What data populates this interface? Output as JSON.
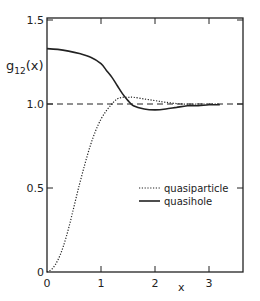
{
  "chart_data": {
    "type": "line",
    "title": "",
    "xlabel": "x",
    "ylabel": "g12(x)",
    "ylabel_main": "g",
    "ylabel_sub": "12",
    "ylabel_arg": "(x)",
    "xlim": [
      0,
      3.65
    ],
    "ylim": [
      0,
      1.5
    ],
    "xticks": [
      0,
      1,
      2,
      3
    ],
    "xtick_labels": [
      "0",
      "1",
      "2",
      "3"
    ],
    "yticks": [
      0,
      0.5,
      1.0,
      1.5
    ],
    "ytick_labels": [
      "0",
      "0.5",
      "1.0",
      "1.5"
    ],
    "grid": false,
    "legend_position": "center-right",
    "reference_line": {
      "y": 1.0,
      "style": "dashed"
    },
    "series": [
      {
        "name": "quasiparticle",
        "style": "dotted",
        "x": [
          0,
          0.1,
          0.2,
          0.3,
          0.4,
          0.5,
          0.6,
          0.7,
          0.8,
          0.9,
          1.0,
          1.1,
          1.2,
          1.3,
          1.4,
          1.5,
          1.6,
          1.8,
          2.0,
          2.2,
          2.5,
          2.8,
          3.0,
          3.2
        ],
        "values": [
          0.0,
          0.02,
          0.07,
          0.15,
          0.26,
          0.39,
          0.52,
          0.64,
          0.75,
          0.84,
          0.91,
          0.96,
          1.0,
          1.03,
          1.04,
          1.04,
          1.04,
          1.03,
          1.02,
          1.01,
          1.0,
          1.0,
          1.0,
          1.0
        ]
      },
      {
        "name": "quasihole",
        "style": "solid",
        "x": [
          0,
          0.2,
          0.4,
          0.6,
          0.8,
          1.0,
          1.1,
          1.2,
          1.3,
          1.4,
          1.5,
          1.6,
          1.8,
          2.0,
          2.2,
          2.4,
          2.6,
          2.8,
          3.0,
          3.2
        ],
        "values": [
          1.33,
          1.325,
          1.315,
          1.3,
          1.28,
          1.24,
          1.2,
          1.16,
          1.11,
          1.06,
          1.02,
          0.99,
          0.97,
          0.965,
          0.97,
          0.98,
          0.99,
          0.99,
          0.995,
          0.995
        ]
      }
    ]
  }
}
